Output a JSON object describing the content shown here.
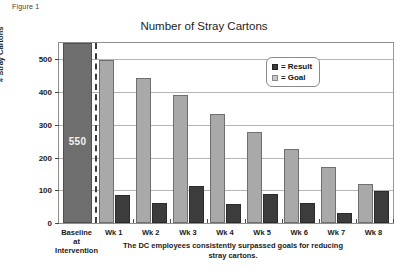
{
  "figure_label": "Figure 1",
  "chart_data": {
    "type": "bar",
    "title": "Number of Stray Cartons",
    "xlabel": "",
    "ylabel": "# Stray Cartons",
    "ylim": [
      0,
      550
    ],
    "yticks": [
      0,
      100,
      200,
      300,
      400,
      500
    ],
    "ytick_labels": [
      "0",
      "100",
      "200",
      "300",
      "400",
      "500"
    ],
    "grid": true,
    "legend_position": "upper right",
    "categories": [
      "Baseline at Intervention",
      "Wk 1",
      "Wk 2",
      "Wk 3",
      "Wk 4",
      "Wk 5",
      "Wk 6",
      "Wk 7",
      "Wk 8"
    ],
    "category_lines": [
      [
        "Baseline",
        "at",
        "Intervention"
      ],
      [
        "Wk 1"
      ],
      [
        "Wk 2"
      ],
      [
        "Wk 3"
      ],
      [
        "Wk 4"
      ],
      [
        "Wk 5"
      ],
      [
        "Wk 6"
      ],
      [
        "Wk 7"
      ],
      [
        "Wk 8"
      ]
    ],
    "series": [
      {
        "name": "Baseline",
        "values": [
          550,
          null,
          null,
          null,
          null,
          null,
          null,
          null,
          null
        ],
        "color": "#6e6e6e",
        "data_labels": [
          "550"
        ]
      },
      {
        "name": "Goal",
        "values": [
          null,
          498,
          443,
          390,
          333,
          278,
          225,
          170,
          118
        ],
        "color": "#a9a9a9"
      },
      {
        "name": "Result",
        "values": [
          null,
          85,
          62,
          113,
          57,
          88,
          60,
          30,
          98
        ],
        "color": "#3c3c3c"
      }
    ],
    "baseline_label": "550",
    "annotations": [
      {
        "type": "vline",
        "label": "intervention-divider",
        "style": "dashed"
      }
    ],
    "caption": "The DC employees consistently surpassed goals for reducing stray cartons."
  },
  "legend": {
    "items": [
      {
        "swatch": "result",
        "eq": "=",
        "label": "Result"
      },
      {
        "swatch": "goal",
        "eq": "=",
        "label": "Goal"
      }
    ]
  }
}
